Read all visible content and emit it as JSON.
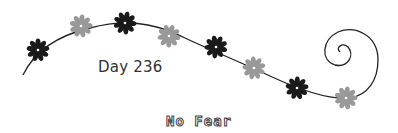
{
  "caption": {
    "day_label": "Day 236",
    "title": "No Fear"
  },
  "colors": {
    "dark_flower": "#1a1a1a",
    "light_flower": "#999999",
    "vine": "#222222",
    "background": "#ffffff"
  },
  "flowers": [
    {
      "x": 38,
      "y": 50,
      "tone": "dark"
    },
    {
      "x": 81,
      "y": 26,
      "tone": "light"
    },
    {
      "x": 125,
      "y": 23,
      "tone": "dark"
    },
    {
      "x": 169,
      "y": 36,
      "tone": "light"
    },
    {
      "x": 216,
      "y": 47,
      "tone": "dark"
    },
    {
      "x": 254,
      "y": 68,
      "tone": "light"
    },
    {
      "x": 297,
      "y": 88,
      "tone": "dark"
    },
    {
      "x": 346,
      "y": 98,
      "tone": "light"
    }
  ]
}
